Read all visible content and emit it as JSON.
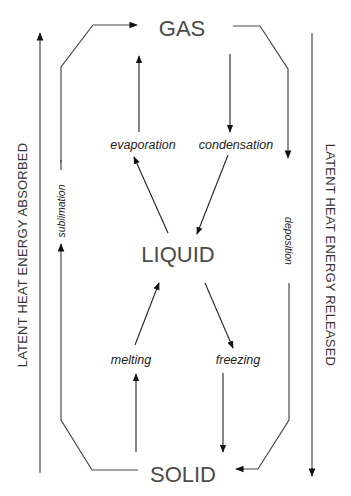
{
  "diagram": {
    "type": "phase-change-diagram",
    "states": {
      "gas": "GAS",
      "liquid": "LIQUID",
      "solid": "SOLID"
    },
    "processes": {
      "evaporation": "evaporation",
      "condensation": "condensation",
      "melting": "melting",
      "freezing": "freezing",
      "sublimation": "sublimation",
      "deposition": "deposition"
    },
    "side_labels": {
      "left": "LATENT HEAT ENERGY ABSORBED",
      "right": "LATENT HEAT ENERGY RELEASED"
    },
    "transitions": [
      {
        "from": "LIQUID",
        "to": "GAS",
        "label": "evaporation",
        "direction": "up"
      },
      {
        "from": "GAS",
        "to": "LIQUID",
        "label": "condensation",
        "direction": "down"
      },
      {
        "from": "SOLID",
        "to": "LIQUID",
        "label": "melting",
        "direction": "up"
      },
      {
        "from": "LIQUID",
        "to": "SOLID",
        "label": "freezing",
        "direction": "down"
      },
      {
        "from": "SOLID",
        "to": "GAS",
        "label": "sublimation",
        "direction": "up"
      },
      {
        "from": "GAS",
        "to": "SOLID",
        "label": "deposition",
        "direction": "down"
      }
    ],
    "colors": {
      "text": "#4a4a4a",
      "lines": "#4a4a4a",
      "background": "#ffffff"
    }
  }
}
